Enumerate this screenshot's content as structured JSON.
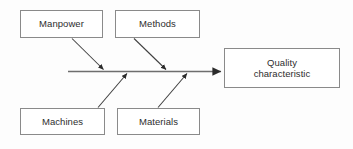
{
  "diagram": {
    "type": "fishbone",
    "effect": {
      "id": "effect",
      "label": "Quality\ncharacteristic",
      "line1": "Quality",
      "line2": "characteristic"
    },
    "causes": [
      {
        "id": "manpower",
        "label": "Manpower",
        "position": "top-left"
      },
      {
        "id": "methods",
        "label": "Methods",
        "position": "top-right"
      },
      {
        "id": "machines",
        "label": "Machines",
        "position": "bottom-left"
      },
      {
        "id": "materials",
        "label": "Materials",
        "position": "bottom-right"
      }
    ],
    "colors": {
      "background": "#fdfdfd",
      "box_border": "#8a8a8a",
      "box_fill": "#ffffff",
      "text": "#2e2e2e",
      "spine": "#6e6e6e",
      "bone": "#3a3a3a"
    },
    "spine": {
      "label": "main-spine",
      "x_start": 68,
      "x_end": 224,
      "y": 71,
      "arrowhead": "right"
    },
    "bones": [
      {
        "cause": "manpower",
        "from": [
          72,
          38
        ],
        "to": [
          105,
          71
        ],
        "direction": "down-right"
      },
      {
        "cause": "methods",
        "from": [
          134,
          38
        ],
        "to": [
          168,
          71
        ],
        "direction": "down-right"
      },
      {
        "cause": "machines",
        "from": [
          98,
          108
        ],
        "to": [
          128,
          72
        ],
        "direction": "up-right"
      },
      {
        "cause": "materials",
        "from": [
          158,
          108
        ],
        "to": [
          188,
          72
        ],
        "direction": "up-right"
      }
    ]
  }
}
